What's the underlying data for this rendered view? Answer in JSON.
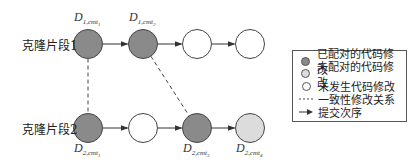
{
  "rows": [
    {
      "label": "克隆片段1",
      "y": 44,
      "nodes": [
        {
          "x": 88,
          "state": "paired",
          "label_main": "D",
          "label_sub": "1,cmt",
          "label_subsub": "1",
          "label_pos": "above"
        },
        {
          "x": 143,
          "state": "paired",
          "label_main": "D",
          "label_sub": "1,cmt",
          "label_subsub": "2",
          "label_pos": "above"
        },
        {
          "x": 197,
          "state": "none"
        },
        {
          "x": 250,
          "state": "none"
        }
      ]
    },
    {
      "label": "克隆片段2",
      "y": 128,
      "nodes": [
        {
          "x": 88,
          "state": "paired",
          "label_main": "D",
          "label_sub": "2,cmt",
          "label_subsub": "1",
          "label_pos": "below"
        },
        {
          "x": 143,
          "state": "none"
        },
        {
          "x": 197,
          "state": "paired",
          "label_main": "D",
          "label_sub": "2,cmt",
          "label_subsub": "3",
          "label_pos": "below"
        },
        {
          "x": 250,
          "state": "unpaired",
          "label_main": "D",
          "label_sub": "2,cmt",
          "label_subsub": "4",
          "label_pos": "below"
        }
      ]
    }
  ],
  "consistency_links": [
    {
      "from": [
        88,
        44
      ],
      "to": [
        88,
        128
      ]
    },
    {
      "from": [
        143,
        44
      ],
      "to": [
        197,
        128
      ]
    }
  ],
  "colors": {
    "paired": "#8a8a8a",
    "unpaired": "#dcdcdc",
    "none": "#ffffff",
    "stroke": "#444444"
  },
  "legend": {
    "items": [
      {
        "symbol": "paired-dot",
        "label": "已配对的代码修改"
      },
      {
        "symbol": "unpaired-dot",
        "label": "未配对的代码修改"
      },
      {
        "symbol": "empty-dot",
        "label": "未发生代码修改"
      },
      {
        "symbol": "dashed-line",
        "label": "一致性修改关系"
      },
      {
        "symbol": "arrow",
        "label": "提交次序"
      }
    ]
  }
}
